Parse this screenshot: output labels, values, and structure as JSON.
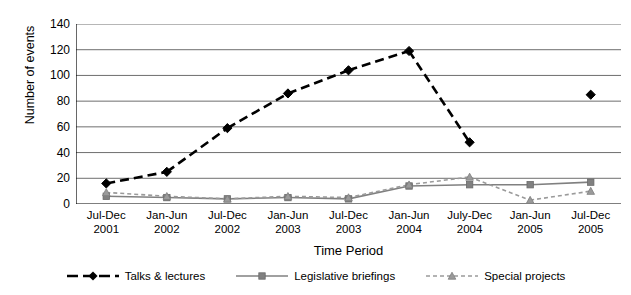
{
  "chart_data": {
    "type": "line",
    "title": "",
    "xlabel": "Time Period",
    "ylabel": "Number of events",
    "ylim": [
      0,
      140
    ],
    "ytick_step": 20,
    "yticks": [
      140,
      120,
      100,
      80,
      60,
      40,
      20,
      0
    ],
    "grid": true,
    "legend_position": "bottom",
    "categories": [
      "Jul-Dec 2001",
      "Jan-Jun 2002",
      "Jul-Dec 2002",
      "Jan-Jun 2003",
      "Jul-Dec 2003",
      "Jan-Jun 2004",
      "July-Dec 2004",
      "Jan-Jun 2005",
      "Jul-Dec 2005"
    ],
    "series": [
      {
        "name": "Talks & lectures",
        "color": "#000000",
        "marker": "diamond",
        "linestyle": "dashed",
        "values": [
          16,
          25,
          59,
          86,
          104,
          119,
          48,
          null,
          85
        ]
      },
      {
        "name": "Legislative briefings",
        "color": "#808080",
        "marker": "square",
        "linestyle": "solid",
        "values": [
          6,
          5,
          4,
          5,
          4,
          14,
          15,
          15,
          17
        ]
      },
      {
        "name": "Special projects",
        "color": "#9a9a9a",
        "marker": "triangle",
        "linestyle": "dashed",
        "values": [
          9,
          6,
          4,
          6,
          5,
          15,
          21,
          3,
          10
        ]
      }
    ]
  },
  "axis": {
    "y_title": "Number of events",
    "x_title": "Time Period",
    "y_ticks": [
      "140",
      "120",
      "100",
      "80",
      "60",
      "40",
      "20",
      "0"
    ],
    "x_ticks": [
      {
        "line1": "Jul-Dec",
        "line2": "2001"
      },
      {
        "line1": "Jan-Jun",
        "line2": "2002"
      },
      {
        "line1": "Jul-Dec",
        "line2": "2002"
      },
      {
        "line1": "Jan-Jun",
        "line2": "2003"
      },
      {
        "line1": "Jul-Dec",
        "line2": "2003"
      },
      {
        "line1": "Jan-Jun",
        "line2": "2004"
      },
      {
        "line1": "July-Dec",
        "line2": "2004"
      },
      {
        "line1": "Jan-Jun",
        "line2": "2005"
      },
      {
        "line1": "Jul-Dec",
        "line2": "2005"
      }
    ]
  },
  "legend": {
    "items": [
      {
        "label": "Talks & lectures",
        "color": "#000000",
        "marker": "diamond",
        "linestyle": "dashed"
      },
      {
        "label": "Legislative briefings",
        "color": "#808080",
        "marker": "square",
        "linestyle": "solid"
      },
      {
        "label": "Special projects",
        "color": "#9a9a9a",
        "marker": "triangle",
        "linestyle": "dashed"
      }
    ]
  },
  "colors": {
    "axis": "#000000",
    "grid": "#6e6e6e",
    "series_dark": "#000000",
    "series_gray": "#808080",
    "series_light_gray": "#9a9a9a",
    "background": "#ffffff"
  }
}
